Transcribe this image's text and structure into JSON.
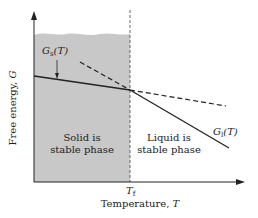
{
  "diagram": {
    "axes": {
      "y_label": "Free energy, ",
      "y_symbol": "G",
      "x_label": "Temperature, ",
      "x_symbol": "T"
    },
    "curves": {
      "solid": {
        "symbol": "G",
        "subscript": "s",
        "arg": "(T)"
      },
      "liquid": {
        "symbol": "G",
        "subscript": "l",
        "arg": "(T)"
      }
    },
    "regions": {
      "solid_line1": "Solid is",
      "solid_line2": "stable phase",
      "liquid_line1": "Liquid is",
      "liquid_line2": "stable phase"
    },
    "tick": {
      "symbol": "T",
      "subscript": "f"
    },
    "colors": {
      "shade": "#c8c8c8",
      "line": "#222222",
      "background": "#ffffff"
    }
  }
}
